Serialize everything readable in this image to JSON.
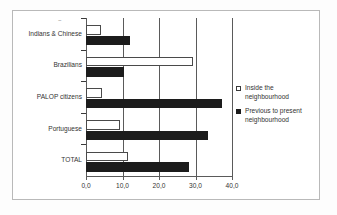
{
  "chart_data": {
    "type": "bar",
    "orientation": "horizontal",
    "title": "",
    "subtitle": "",
    "xlabel": "",
    "ylabel": "",
    "categories": [
      "Indians & Chinese",
      "Brazilians",
      "PALOP citizens",
      "Portuguese",
      "TOTAL"
    ],
    "series": [
      {
        "name": "Inside the neighbourhood",
        "color": "#ffffff",
        "edge_color": "#4a4a4a",
        "values": [
          4.0,
          29.3,
          4.3,
          9.4,
          11.4
        ]
      },
      {
        "name": "Previous to present neighbourhood",
        "color": "#1c1c1c",
        "edge_color": "#1c1c1c",
        "values": [
          12.0,
          10.4,
          37.3,
          33.5,
          28.2
        ]
      }
    ],
    "xlim": [
      0,
      40
    ],
    "xticks": [
      0,
      10,
      20,
      30,
      40
    ],
    "xtick_labels": [
      "0,0",
      "10,0",
      "20,0",
      "30,0",
      "40,0"
    ],
    "decimal_separator": ",",
    "grid": true,
    "grid_axis": "x",
    "legend_position": "right"
  },
  "legend": {
    "entries": [
      {
        "label": "Inside the neighbourhood",
        "marker": "hollow-square-icon"
      },
      {
        "label": "Previous to present neighbourhood",
        "marker": "filled-square-icon"
      }
    ]
  },
  "axis": {
    "tick_labels": [
      "0,0",
      "10,0",
      "20,0",
      "30,0",
      "40,0"
    ]
  },
  "categories": [
    "Indians & Chinese",
    "Brazilians",
    "PALOP citizens",
    "Portuguese",
    "TOTAL"
  ],
  "speckle": "~"
}
